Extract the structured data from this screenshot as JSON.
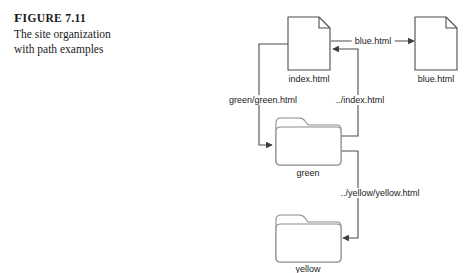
{
  "figure": {
    "label": "Figure 7.11",
    "label_prefix": "F",
    "label_rest": "IGURE",
    "label_number": "7.11",
    "caption_line1": "The site organization",
    "caption_line2": "with path examples"
  },
  "colors": {
    "background": "#ffffff",
    "stroke": "#4d4d4d",
    "text": "#1a1a1a",
    "shape_fill": "#ffffff"
  },
  "diagram": {
    "type": "site-organization-path-diagram",
    "nodes": [
      {
        "id": "index",
        "kind": "document-icon",
        "label": "index.html",
        "x": 309,
        "y": 43
      },
      {
        "id": "blue",
        "kind": "document-icon",
        "label": "blue.html",
        "x": 436,
        "y": 43
      },
      {
        "id": "green",
        "kind": "folder-icon",
        "label": "green",
        "x": 307,
        "y": 141
      },
      {
        "id": "yellow",
        "kind": "folder-icon",
        "label": "yellow",
        "x": 307,
        "y": 238
      }
    ],
    "edges": [
      {
        "id": "edge-blue",
        "from": "index",
        "to": "blue",
        "label": "blue.html"
      },
      {
        "id": "edge-green",
        "from": "index",
        "to": "green",
        "label": "green/green.html"
      },
      {
        "id": "edge-index",
        "from": "green",
        "to": "index",
        "label": "../index.html"
      },
      {
        "id": "edge-yellow",
        "from": "green",
        "to": "yellow",
        "label": "../yellow/yellow.html"
      }
    ]
  }
}
